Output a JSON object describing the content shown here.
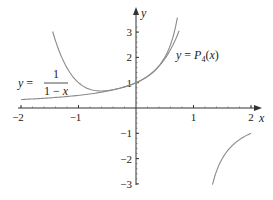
{
  "chart_data": {
    "type": "line",
    "title": "",
    "xlabel": "x",
    "ylabel": "y",
    "xlim": [
      -2,
      2
    ],
    "ylim": [
      -3,
      3
    ],
    "x_ticks": [
      -2,
      -1,
      1,
      2
    ],
    "y_ticks": [
      -3,
      -2,
      -1,
      1,
      2,
      3
    ],
    "x_tick_labels": [
      "−2",
      "−1",
      "1",
      "2"
    ],
    "y_tick_labels": [
      "−3",
      "−2",
      "−1",
      "1",
      "2",
      "3"
    ],
    "grid": false,
    "legend": null,
    "series": [
      {
        "name": "y = 1/(1 − x)",
        "formula": "1/(1-x)",
        "branches": [
          {
            "x": [
              -2.0,
              -1.5,
              -1.0,
              -0.5,
              0.0,
              0.25,
              0.5,
              0.6,
              0.68,
              0.72
            ],
            "y": [
              0.333,
              0.4,
              0.5,
              0.667,
              1.0,
              1.333,
              2.0,
              2.5,
              3.125,
              3.571
            ]
          },
          {
            "x": [
              1.33,
              1.4,
              1.5,
              1.67,
              1.8,
              2.0
            ],
            "y": [
              -3.0,
              -2.5,
              -2.0,
              -1.5,
              -1.25,
              -1.0
            ]
          }
        ]
      },
      {
        "name": "y = P4(x)",
        "formula": "1 + x + x^2 + x^3 + x^4",
        "branches": [
          {
            "x": [
              -1.45,
              -1.3,
              -1.0,
              -0.7,
              -0.5,
              -0.25,
              0.0,
              0.25,
              0.5,
              0.65,
              0.75
            ],
            "y": [
              3.02,
              2.22,
              1.0,
              0.73,
              0.69,
              0.8,
              1.0,
              1.33,
              1.94,
              2.55,
              3.05
            ]
          }
        ]
      }
    ],
    "annotations": [
      {
        "text": "y = 1/(1 − x)",
        "position": "left, near (−1.6, 0.9)"
      },
      {
        "text": "y = P4(x)",
        "position": "right, near (1.0, 2.2)"
      }
    ]
  },
  "labels": {
    "x_axis": "x",
    "y_axis": "y",
    "annot_left_prefix": "y =",
    "annot_left_num": "1",
    "annot_left_den": "1 − x",
    "annot_right_y": "y",
    "annot_right_eq": " = ",
    "annot_right_P": "P",
    "annot_right_sub": "4",
    "annot_right_arg": "(x)"
  }
}
